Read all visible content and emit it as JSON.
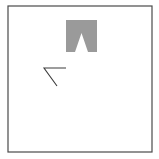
{
  "canvas": {
    "width": 159,
    "height": 159,
    "background_color": "#ffffff",
    "description": "Minimal line-drawing canvas with two abstract shapes inside a thin square frame"
  },
  "frame": {
    "label": "Canvas border frame",
    "x": 8,
    "y": 6,
    "width": 144,
    "height": 146,
    "stroke_color": "#4a4a4a",
    "stroke_width": 1.2,
    "fill": "none"
  },
  "shapes": [
    {
      "id": "notched-block",
      "label": "Gray block with triangular notch",
      "kind": "polygon",
      "fill_color": "#9a9a9a",
      "stroke": "none",
      "bounds": {
        "x": 66,
        "y": 20,
        "width": 31,
        "height": 32
      },
      "points": "66,20 97,20 97,52 88,52 81.5,33 75,52 66,52"
    },
    {
      "id": "angle-mark",
      "label": "Thin dark angle mark (horizontal stroke plus descending diagonal)",
      "kind": "polyline",
      "stroke_color": "#3c3c3c",
      "stroke_width": 1.1,
      "fill": "none",
      "bounds": {
        "x": 44,
        "y": 68,
        "width": 22,
        "height": 18
      },
      "points": "66,68 44,68 57,86"
    }
  ]
}
